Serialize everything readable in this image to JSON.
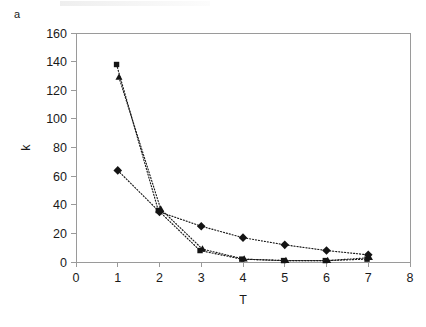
{
  "figure": {
    "panel_label": "a",
    "background_color": "#ffffff",
    "axis_color": "#9a9a9a",
    "marker_color": "#141414"
  },
  "chart_data": {
    "type": "line",
    "title": "",
    "subtitle": "",
    "xlabel": "T",
    "ylabel": "k",
    "xlim": [
      0,
      8
    ],
    "ylim": [
      0,
      160
    ],
    "x_ticks": [
      0,
      1,
      2,
      3,
      4,
      5,
      6,
      7,
      8
    ],
    "x_tick_labels": [
      "0",
      "1",
      "2",
      "3",
      "4",
      "5",
      "6",
      "7",
      "8"
    ],
    "y_ticks": [
      0,
      20,
      40,
      60,
      80,
      100,
      120,
      140,
      160
    ],
    "y_tick_labels": [
      "0",
      "20",
      "40",
      "60",
      "80",
      "100",
      "120",
      "140",
      "160"
    ],
    "grid": false,
    "legend": false,
    "legend_position": "none",
    "line_style": "dotted",
    "x": [
      1,
      2,
      3,
      4,
      5,
      6,
      7
    ],
    "series": [
      {
        "name": "series-square",
        "marker": "square",
        "values": [
          138,
          36,
          8,
          2,
          1,
          1,
          2
        ]
      },
      {
        "name": "series-triangle",
        "marker": "triangle",
        "values": [
          129,
          37,
          9,
          2,
          1,
          1,
          3
        ]
      },
      {
        "name": "series-diamond",
        "marker": "diamond",
        "values": [
          64,
          35,
          25,
          17,
          12,
          8,
          5
        ]
      }
    ],
    "annotations": []
  }
}
